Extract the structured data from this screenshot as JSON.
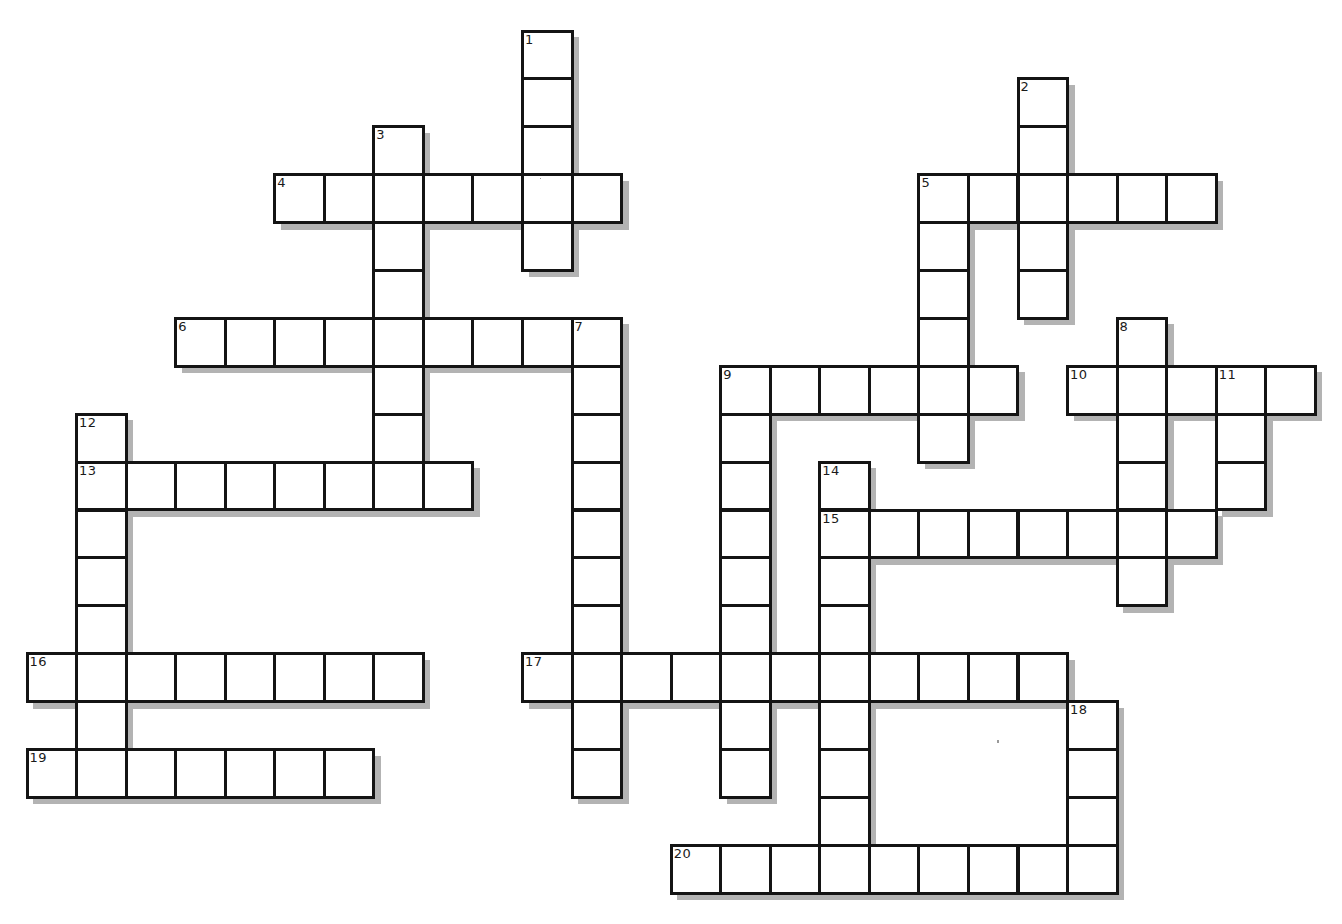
{
  "puzzle": {
    "type": "crossword",
    "grid": {
      "origin_x": 27,
      "origin_y": 31,
      "cell_w": 49.55,
      "cell_h": 47.9,
      "cols": 26,
      "rows": 18
    },
    "colors": {
      "line": "#141414",
      "cell_fill": "#ffffff",
      "shadow": "#b3b3b3",
      "background": "#ffffff"
    },
    "words": [
      {
        "number": "1",
        "direction": "down",
        "col": 10,
        "row": 0,
        "length": 5
      },
      {
        "number": "2",
        "direction": "down",
        "col": 20,
        "row": 1,
        "length": 5
      },
      {
        "number": "3",
        "direction": "down",
        "col": 7,
        "row": 2,
        "length": 8
      },
      {
        "number": "4",
        "direction": "across",
        "col": 5,
        "row": 3,
        "length": 7
      },
      {
        "number": "5",
        "direction": "across",
        "col": 18,
        "row": 3,
        "length": 6
      },
      {
        "number": "5",
        "direction": "down",
        "col": 18,
        "row": 3,
        "length": 6
      },
      {
        "number": "6",
        "direction": "across",
        "col": 3,
        "row": 6,
        "length": 9
      },
      {
        "number": "7",
        "direction": "down",
        "col": 11,
        "row": 6,
        "length": 10
      },
      {
        "number": "8",
        "direction": "down",
        "col": 22,
        "row": 6,
        "length": 6
      },
      {
        "number": "9",
        "direction": "across",
        "col": 14,
        "row": 7,
        "length": 6
      },
      {
        "number": "9",
        "direction": "down",
        "col": 14,
        "row": 7,
        "length": 9
      },
      {
        "number": "10",
        "direction": "across",
        "col": 21,
        "row": 7,
        "length": 5
      },
      {
        "number": "11",
        "direction": "down",
        "col": 24,
        "row": 7,
        "length": 3
      },
      {
        "number": "12",
        "direction": "down",
        "col": 1,
        "row": 8,
        "length": 7
      },
      {
        "number": "13",
        "direction": "across",
        "col": 1,
        "row": 9,
        "length": 8
      },
      {
        "number": "14",
        "direction": "down",
        "col": 16,
        "row": 9,
        "length": 9
      },
      {
        "number": "15",
        "direction": "across",
        "col": 16,
        "row": 10,
        "length": 8
      },
      {
        "number": "16",
        "direction": "across",
        "col": 0,
        "row": 13,
        "length": 8
      },
      {
        "number": "17",
        "direction": "across",
        "col": 10,
        "row": 13,
        "length": 11
      },
      {
        "number": "18",
        "direction": "down",
        "col": 21,
        "row": 14,
        "length": 4
      },
      {
        "number": "19",
        "direction": "across",
        "col": 0,
        "row": 15,
        "length": 7
      },
      {
        "number": "20",
        "direction": "across",
        "col": 13,
        "row": 17,
        "length": 9
      }
    ],
    "labels": [
      {
        "number": "1",
        "col": 10,
        "row": 0
      },
      {
        "number": "2",
        "col": 20,
        "row": 1
      },
      {
        "number": "3",
        "col": 7,
        "row": 2
      },
      {
        "number": "4",
        "col": 5,
        "row": 3
      },
      {
        "number": "5",
        "col": 18,
        "row": 3
      },
      {
        "number": "6",
        "col": 3,
        "row": 6
      },
      {
        "number": "7",
        "col": 11,
        "row": 6
      },
      {
        "number": "8",
        "col": 22,
        "row": 6
      },
      {
        "number": "9",
        "col": 14,
        "row": 7
      },
      {
        "number": "10",
        "col": 21,
        "row": 7
      },
      {
        "number": "11",
        "col": 24,
        "row": 7
      },
      {
        "number": "12",
        "col": 1,
        "row": 8
      },
      {
        "number": "13",
        "col": 1,
        "row": 9
      },
      {
        "number": "14",
        "col": 16,
        "row": 9
      },
      {
        "number": "15",
        "col": 16,
        "row": 10
      },
      {
        "number": "16",
        "col": 0,
        "row": 13
      },
      {
        "number": "17",
        "col": 10,
        "row": 13
      },
      {
        "number": "18",
        "col": 21,
        "row": 14
      },
      {
        "number": "19",
        "col": 0,
        "row": 15
      },
      {
        "number": "20",
        "col": 13,
        "row": 17
      }
    ]
  }
}
